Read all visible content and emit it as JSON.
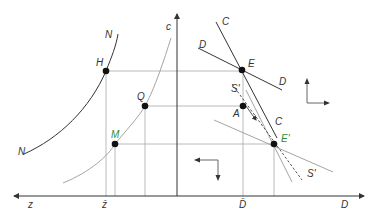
{
  "diagram": {
    "axes": {
      "horizontal_left_label": "z",
      "horizontal_right_label": "D",
      "vertical_label": "c",
      "z_bar_label": "z̄",
      "d_bar_label": "D̄"
    },
    "curves": {
      "N_upper_label": "N",
      "N_lower_label": "N",
      "c_curve_label": "c",
      "C_line_top_label": "C",
      "C_line_lower_label": "C",
      "D_line_left_label": "D",
      "D_line_right_label": "D",
      "S_line_top_label": "S'",
      "S_line_bottom_label": "S'"
    },
    "points": [
      {
        "id": "H",
        "label": "H",
        "x": 106,
        "y": 71
      },
      {
        "id": "E",
        "label": "E",
        "x": 242,
        "y": 70
      },
      {
        "id": "Q",
        "label": "Q",
        "x": 145,
        "y": 106
      },
      {
        "id": "A",
        "label": "A",
        "x": 243,
        "y": 106
      },
      {
        "id": "M",
        "label": "M",
        "x": 115,
        "y": 144
      },
      {
        "id": "E_prime",
        "label": "E'",
        "x": 274,
        "y": 144
      }
    ],
    "colors": {
      "line_dark": "#333333",
      "line_light": "#9a9a9a",
      "grid": "#a8a8a8",
      "label_green": "#2e8b3a"
    }
  }
}
